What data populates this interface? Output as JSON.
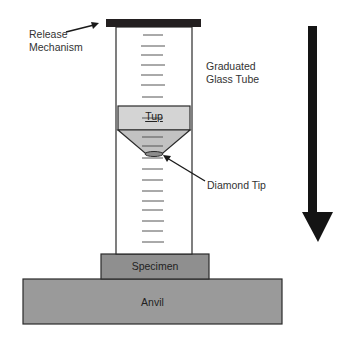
{
  "diagram": {
    "type": "drop-weight impact tester schematic",
    "labels": {
      "release_mechanism": [
        "Release",
        "Mechanism"
      ],
      "glass_tube": [
        "Graduated",
        "Glass Tube"
      ],
      "tup": "Tup",
      "diamond_tip": "Diamond Tip",
      "specimen": "Specimen",
      "anvil": "Anvil"
    },
    "colors": {
      "release_bar": "#231f20",
      "tube_outline": "#2a2a2a",
      "tup_fill": "#d4d4d4",
      "tup_cone_fill": "#c2c2c2",
      "diamond_tip_fill": "#8c8c8c",
      "specimen_fill": "#8f8f8f",
      "anvil_fill": "#9a9a9a",
      "arrow": "#141414",
      "graduation": "#555555"
    },
    "graduation_marks_count": 22,
    "direction_arrow": "down"
  }
}
